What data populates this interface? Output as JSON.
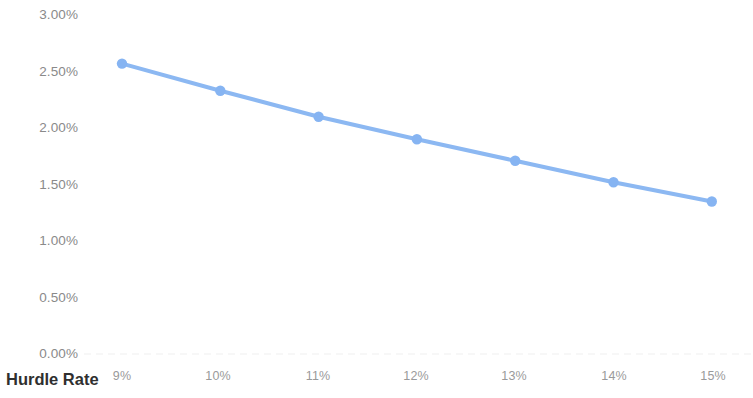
{
  "chart_data": {
    "type": "line",
    "title": "",
    "subtitle": "",
    "xlabel": "Hurdle Rate",
    "ylabel": "",
    "grid": "faint-dotted-baseline-only",
    "legend": "none",
    "x": [
      "9%",
      "10%",
      "11%",
      "12%",
      "13%",
      "14%",
      "15%"
    ],
    "categories": [
      "9%",
      "10%",
      "11%",
      "12%",
      "13%",
      "14%",
      "15%"
    ],
    "values": [
      2.57,
      2.33,
      2.1,
      1.9,
      1.71,
      1.52,
      1.35
    ],
    "value_labels": [
      "2.57%",
      "2.33%",
      "2.10%",
      "1.90%",
      "1.71%",
      "1.52%",
      "1.35%"
    ],
    "series": [
      {
        "name": "",
        "values": [
          2.57,
          2.33,
          2.1,
          1.9,
          1.71,
          1.52,
          1.35
        ]
      }
    ],
    "ylim": [
      0.0,
      3.0
    ],
    "ytick_values": [
      3.0,
      2.5,
      2.0,
      1.5,
      1.0,
      0.5,
      0.0
    ],
    "ytick_labels": [
      "3.00%",
      "2.50%",
      "2.00%",
      "1.50%",
      "1.00%",
      "0.50%",
      "0.00%"
    ],
    "xtick_labels": [
      "9%",
      "10%",
      "11%",
      "12%",
      "13%",
      "14%",
      "15%"
    ]
  },
  "style": {
    "series_color": "#8cb8f2",
    "marker_color": "#86b4f2",
    "grid_color": "#ededed",
    "y_label_color": "#8a8a8a",
    "x_label_color": "#9a9a9a",
    "axis_title_color": "#2f2f2f",
    "background": "#ffffff"
  },
  "axis_title": {
    "x": "Hurdle Rate"
  }
}
